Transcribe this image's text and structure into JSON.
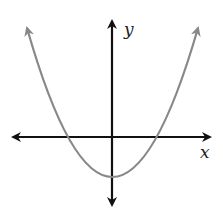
{
  "diagram": {
    "type": "parabola-graph",
    "axes": {
      "x_label": "x",
      "y_label": "y"
    },
    "colors": {
      "axis": "#111111",
      "curve": "#888888"
    },
    "curve": {
      "description": "upward-opening parabola, vertex below x-axis on y-axis, two x-intercepts"
    }
  }
}
